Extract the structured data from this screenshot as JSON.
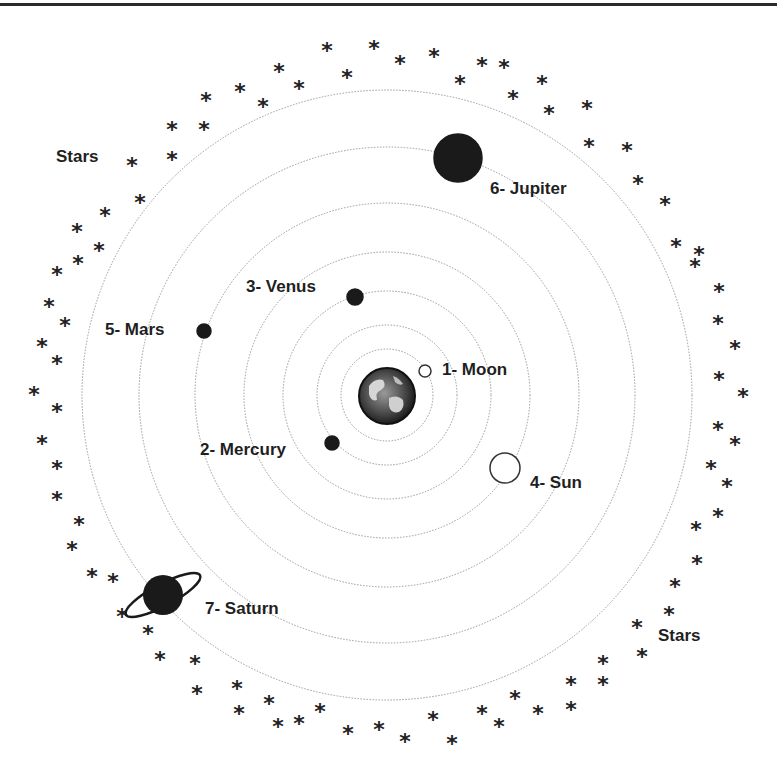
{
  "diagram": {
    "type": "geocentric-model",
    "center": {
      "x": 387,
      "y": 395
    },
    "orbit_radii": [
      46,
      70,
      104,
      143,
      192,
      248,
      305
    ],
    "colors": {
      "orbit": "#9a9a9a",
      "planet": "#1a1a1a",
      "label": "#1f1f1f",
      "rule": "#2a2a2a"
    },
    "earth": {
      "name": "Earth",
      "x": 387,
      "y": 396,
      "r": 28
    }
  },
  "bodies": [
    {
      "id": "moon",
      "label": "1- Moon",
      "x": 425,
      "y": 371,
      "r": 6,
      "fill": "#ffffff",
      "stroke": "#333333",
      "label_x": 442,
      "label_y": 375
    },
    {
      "id": "mercury",
      "label": "2- Mercury",
      "x": 332,
      "y": 443,
      "r": 7,
      "fill": "#1a1a1a",
      "stroke": "#1a1a1a",
      "label_x": 200,
      "label_y": 455
    },
    {
      "id": "venus",
      "label": "3- Venus",
      "x": 355,
      "y": 297,
      "r": 8,
      "fill": "#1a1a1a",
      "stroke": "#1a1a1a",
      "label_x": 246,
      "label_y": 292
    },
    {
      "id": "sun",
      "label": "4- Sun",
      "x": 505,
      "y": 468,
      "r": 15,
      "fill": "#ffffff",
      "stroke": "#333333",
      "label_x": 530,
      "label_y": 488
    },
    {
      "id": "mars",
      "label": "5- Mars",
      "x": 204,
      "y": 331,
      "r": 7,
      "fill": "#1a1a1a",
      "stroke": "#1a1a1a",
      "label_x": 105,
      "label_y": 335
    },
    {
      "id": "jupiter",
      "label": "6- Jupiter",
      "x": 458,
      "y": 158,
      "r": 24,
      "fill": "#1a1a1a",
      "stroke": "#1a1a1a",
      "label_x": 490,
      "label_y": 194
    },
    {
      "id": "saturn",
      "label": "7- Saturn",
      "x": 163,
      "y": 595,
      "r": 20,
      "fill": "#1a1a1a",
      "stroke": "#1a1a1a",
      "label_x": 205,
      "label_y": 614
    }
  ],
  "star_labels": [
    {
      "text": "Stars",
      "x": 56,
      "y": 162
    },
    {
      "text": "Stars",
      "x": 658,
      "y": 641
    }
  ],
  "star_glyph": "*",
  "stars": [
    [
      132,
      164
    ],
    [
      140,
      201
    ],
    [
      105,
      214
    ],
    [
      99,
      249
    ],
    [
      172,
      128
    ],
    [
      172,
      158
    ],
    [
      204,
      128
    ],
    [
      206,
      99
    ],
    [
      240,
      90
    ],
    [
      263,
      105
    ],
    [
      279,
      70
    ],
    [
      299,
      87
    ],
    [
      327,
      49
    ],
    [
      347,
      76
    ],
    [
      374,
      47
    ],
    [
      400,
      62
    ],
    [
      434,
      55
    ],
    [
      460,
      82
    ],
    [
      482,
      64
    ],
    [
      504,
      66
    ],
    [
      513,
      97
    ],
    [
      542,
      82
    ],
    [
      549,
      112
    ],
    [
      587,
      107
    ],
    [
      589,
      145
    ],
    [
      627,
      149
    ],
    [
      638,
      182
    ],
    [
      665,
      203
    ],
    [
      676,
      245
    ],
    [
      699,
      253
    ],
    [
      695,
      265
    ],
    [
      719,
      290
    ],
    [
      718,
      322
    ],
    [
      735,
      347
    ],
    [
      719,
      378
    ],
    [
      743,
      395
    ],
    [
      718,
      428
    ],
    [
      735,
      443
    ],
    [
      711,
      467
    ],
    [
      727,
      485
    ],
    [
      718,
      515
    ],
    [
      696,
      528
    ],
    [
      697,
      562
    ],
    [
      675,
      585
    ],
    [
      669,
      613
    ],
    [
      637,
      626
    ],
    [
      642,
      655
    ],
    [
      603,
      662
    ],
    [
      603,
      683
    ],
    [
      571,
      683
    ],
    [
      571,
      708
    ],
    [
      538,
      712
    ],
    [
      515,
      697
    ],
    [
      499,
      725
    ],
    [
      482,
      712
    ],
    [
      452,
      742
    ],
    [
      433,
      718
    ],
    [
      405,
      740
    ],
    [
      379,
      728
    ],
    [
      348,
      732
    ],
    [
      320,
      710
    ],
    [
      299,
      722
    ],
    [
      278,
      725
    ],
    [
      269,
      702
    ],
    [
      239,
      712
    ],
    [
      237,
      687
    ],
    [
      197,
      692
    ],
    [
      195,
      662
    ],
    [
      160,
      658
    ],
    [
      148,
      632
    ],
    [
      122,
      615
    ],
    [
      113,
      580
    ],
    [
      92,
      575
    ],
    [
      72,
      548
    ],
    [
      79,
      523
    ],
    [
      57,
      498
    ],
    [
      57,
      467
    ],
    [
      42,
      442
    ],
    [
      57,
      410
    ],
    [
      34,
      393
    ],
    [
      57,
      362
    ],
    [
      42,
      345
    ],
    [
      65,
      324
    ],
    [
      49,
      305
    ],
    [
      57,
      273
    ],
    [
      78,
      262
    ],
    [
      77,
      230
    ]
  ]
}
